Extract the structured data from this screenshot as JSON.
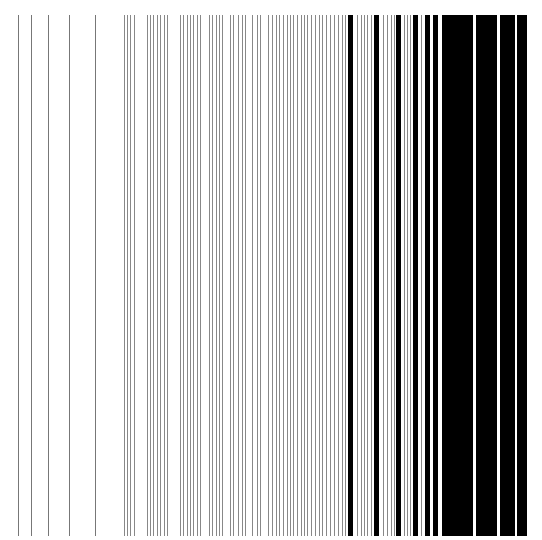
{
  "figure": {
    "background": "#ffffff",
    "line_top": 15,
    "line_bottom": 536,
    "colors": {
      "thin": "#777777",
      "medium": "#888888",
      "thick": "#000000"
    },
    "lines": [
      {
        "x": 18,
        "w": 1,
        "c": "thin"
      },
      {
        "x": 31,
        "w": 1,
        "c": "thin"
      },
      {
        "x": 48,
        "w": 1,
        "c": "thin"
      },
      {
        "x": 69,
        "w": 1,
        "c": "thin"
      },
      {
        "x": 95,
        "w": 1,
        "c": "thin"
      },
      {
        "x": 124,
        "w": 1,
        "c": "medium"
      },
      {
        "x": 127,
        "w": 1,
        "c": "medium"
      },
      {
        "x": 130,
        "w": 1,
        "c": "medium"
      },
      {
        "x": 134,
        "w": 1,
        "c": "medium"
      },
      {
        "x": 147,
        "w": 1,
        "c": "medium"
      },
      {
        "x": 150,
        "w": 1,
        "c": "medium"
      },
      {
        "x": 153,
        "w": 1,
        "c": "medium"
      },
      {
        "x": 157,
        "w": 1,
        "c": "medium"
      },
      {
        "x": 160,
        "w": 1,
        "c": "medium"
      },
      {
        "x": 164,
        "w": 1,
        "c": "medium"
      },
      {
        "x": 167,
        "w": 1,
        "c": "medium"
      },
      {
        "x": 180,
        "w": 1,
        "c": "medium"
      },
      {
        "x": 183,
        "w": 1,
        "c": "medium"
      },
      {
        "x": 187,
        "w": 1,
        "c": "medium"
      },
      {
        "x": 190,
        "w": 1,
        "c": "medium"
      },
      {
        "x": 193,
        "w": 1,
        "c": "medium"
      },
      {
        "x": 197,
        "w": 1,
        "c": "medium"
      },
      {
        "x": 200,
        "w": 1,
        "c": "medium"
      },
      {
        "x": 209,
        "w": 1,
        "c": "medium"
      },
      {
        "x": 212,
        "w": 1,
        "c": "medium"
      },
      {
        "x": 216,
        "w": 1,
        "c": "medium"
      },
      {
        "x": 219,
        "w": 1,
        "c": "medium"
      },
      {
        "x": 222,
        "w": 1,
        "c": "medium"
      },
      {
        "x": 230,
        "w": 1,
        "c": "medium"
      },
      {
        "x": 233,
        "w": 1,
        "c": "medium"
      },
      {
        "x": 238,
        "w": 1,
        "c": "medium"
      },
      {
        "x": 242,
        "w": 1,
        "c": "medium"
      },
      {
        "x": 245,
        "w": 1,
        "c": "medium"
      },
      {
        "x": 252,
        "w": 1,
        "c": "medium"
      },
      {
        "x": 257,
        "w": 1,
        "c": "medium"
      },
      {
        "x": 260,
        "w": 1,
        "c": "medium"
      },
      {
        "x": 268,
        "w": 1,
        "c": "medium"
      },
      {
        "x": 272,
        "w": 1,
        "c": "medium"
      },
      {
        "x": 276,
        "w": 1,
        "c": "medium"
      },
      {
        "x": 279,
        "w": 1,
        "c": "medium"
      },
      {
        "x": 283,
        "w": 1,
        "c": "medium"
      },
      {
        "x": 287,
        "w": 1,
        "c": "medium"
      },
      {
        "x": 290,
        "w": 1,
        "c": "medium"
      },
      {
        "x": 293,
        "w": 1,
        "c": "medium"
      },
      {
        "x": 297,
        "w": 1,
        "c": "medium"
      },
      {
        "x": 301,
        "w": 1,
        "c": "medium"
      },
      {
        "x": 304,
        "w": 1,
        "c": "medium"
      },
      {
        "x": 307,
        "w": 1,
        "c": "medium"
      },
      {
        "x": 311,
        "w": 1,
        "c": "medium"
      },
      {
        "x": 315,
        "w": 1,
        "c": "medium"
      },
      {
        "x": 319,
        "w": 1,
        "c": "medium"
      },
      {
        "x": 322,
        "w": 1,
        "c": "medium"
      },
      {
        "x": 326,
        "w": 1,
        "c": "medium"
      },
      {
        "x": 330,
        "w": 1,
        "c": "medium"
      },
      {
        "x": 334,
        "w": 1,
        "c": "medium"
      },
      {
        "x": 338,
        "w": 1,
        "c": "medium"
      },
      {
        "x": 342,
        "w": 1,
        "c": "medium"
      },
      {
        "x": 345,
        "w": 1,
        "c": "medium"
      },
      {
        "x": 348,
        "w": 5,
        "c": "thick"
      },
      {
        "x": 357,
        "w": 1,
        "c": "medium"
      },
      {
        "x": 361,
        "w": 1,
        "c": "medium"
      },
      {
        "x": 364,
        "w": 1,
        "c": "medium"
      },
      {
        "x": 367,
        "w": 1,
        "c": "medium"
      },
      {
        "x": 371,
        "w": 1,
        "c": "medium"
      },
      {
        "x": 374,
        "w": 5,
        "c": "thick"
      },
      {
        "x": 383,
        "w": 1,
        "c": "medium"
      },
      {
        "x": 387,
        "w": 1,
        "c": "medium"
      },
      {
        "x": 391,
        "w": 1,
        "c": "medium"
      },
      {
        "x": 394,
        "w": 1,
        "c": "medium"
      },
      {
        "x": 396,
        "w": 5,
        "c": "thick"
      },
      {
        "x": 404,
        "w": 1,
        "c": "medium"
      },
      {
        "x": 407,
        "w": 1,
        "c": "medium"
      },
      {
        "x": 410,
        "w": 1,
        "c": "medium"
      },
      {
        "x": 413,
        "w": 5,
        "c": "thick"
      },
      {
        "x": 421,
        "w": 1,
        "c": "medium"
      },
      {
        "x": 425,
        "w": 5,
        "c": "thick"
      },
      {
        "x": 433,
        "w": 5,
        "c": "thick"
      },
      {
        "x": 442,
        "w": 31,
        "c": "thick"
      },
      {
        "x": 476,
        "w": 21,
        "c": "thick"
      },
      {
        "x": 500,
        "w": 15,
        "c": "thick"
      },
      {
        "x": 517,
        "w": 10,
        "c": "thick"
      }
    ]
  }
}
